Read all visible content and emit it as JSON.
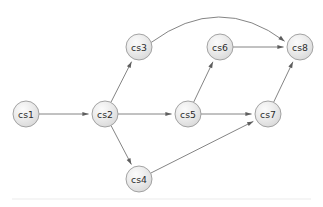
{
  "diagram": {
    "type": "directed-graph",
    "title": "",
    "width": 323,
    "height": 207,
    "background_color": "#ffffff",
    "node_style": {
      "shape": "circle",
      "radius": 13,
      "fill_light": "#f4f4f4",
      "fill_mid": "#e4e4e4",
      "fill_dark": "#d2d2d2",
      "border_color": "#9a9a9a",
      "label_color": "#2b2b2b",
      "label_font_size": 9.3
    },
    "edge_style": {
      "stroke_color": "#767676",
      "stroke_width": 0.9,
      "arrow_color": "#5e5e5e",
      "arrow_length": 6.2,
      "arrow_width": 4.2
    },
    "divider": {
      "color": "#ececec",
      "x1": 12,
      "x2": 311,
      "y": 199
    },
    "nodes": [
      {
        "id": "cs1",
        "label": "cs1",
        "cx": 26,
        "cy": 114,
        "r": 13
      },
      {
        "id": "cs2",
        "label": "cs2",
        "cx": 105,
        "cy": 114,
        "r": 13
      },
      {
        "id": "cs3",
        "label": "cs3",
        "cx": 139,
        "cy": 47,
        "r": 13
      },
      {
        "id": "cs4",
        "label": "cs4",
        "cx": 139,
        "cy": 179,
        "r": 13
      },
      {
        "id": "cs5",
        "label": "cs5",
        "cx": 188,
        "cy": 114,
        "r": 13
      },
      {
        "id": "cs6",
        "label": "cs6",
        "cx": 220,
        "cy": 47,
        "r": 13
      },
      {
        "id": "cs7",
        "label": "cs7",
        "cx": 268,
        "cy": 114,
        "r": 13
      },
      {
        "id": "cs8",
        "label": "cs8",
        "cx": 300,
        "cy": 47,
        "r": 13
      }
    ],
    "edges": [
      {
        "id": "e1",
        "from": "cs1",
        "to": "cs2",
        "curved": false,
        "label": ""
      },
      {
        "id": "e2",
        "from": "cs2",
        "to": "cs3",
        "curved": false,
        "label": ""
      },
      {
        "id": "e3",
        "from": "cs2",
        "to": "cs4",
        "curved": false,
        "label": ""
      },
      {
        "id": "e4",
        "from": "cs2",
        "to": "cs5",
        "curved": false,
        "label": ""
      },
      {
        "id": "e5",
        "from": "cs3",
        "to": "cs8",
        "curved": true,
        "curve_peak_y": 17,
        "label": ""
      },
      {
        "id": "e6",
        "from": "cs4",
        "to": "cs7",
        "curved": false,
        "label": ""
      },
      {
        "id": "e7",
        "from": "cs5",
        "to": "cs6",
        "curved": false,
        "label": ""
      },
      {
        "id": "e8",
        "from": "cs5",
        "to": "cs7",
        "curved": false,
        "label": ""
      },
      {
        "id": "e9",
        "from": "cs6",
        "to": "cs8",
        "curved": false,
        "label": ""
      },
      {
        "id": "e10",
        "from": "cs7",
        "to": "cs8",
        "curved": false,
        "label": ""
      }
    ]
  }
}
